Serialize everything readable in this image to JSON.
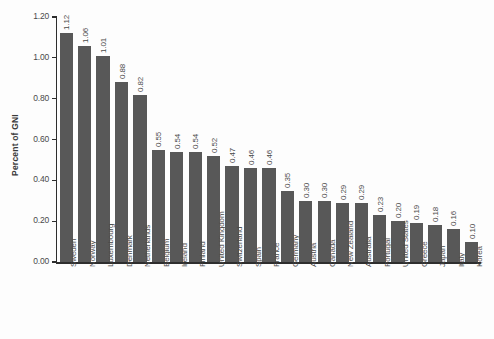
{
  "chart_data": {
    "type": "bar",
    "title": "",
    "subtitle": "",
    "xlabel": "",
    "ylabel": "Percent of GNI",
    "ylim": [
      0.0,
      1.2
    ],
    "ytick_labels": [
      "0.00",
      "0.20",
      "0.40",
      "0.60",
      "0.80",
      "1.00",
      "1.20"
    ],
    "ytick_values": [
      0.0,
      0.2,
      0.4,
      0.6,
      0.8,
      1.0,
      1.2
    ],
    "grid": false,
    "legend": false,
    "bar_color": "#585858",
    "axis_color": "#2e2e2e",
    "background_color": "#fdfdfd",
    "categories": [
      "Sweden",
      "Norway",
      "Luxembourg",
      "Denmark",
      "Netherlands",
      "Belgium",
      "Ireland",
      "Finland",
      "United Kingdom",
      "Switzerland",
      "Spain",
      "France",
      "Germany",
      "Austria",
      "Canada",
      "New Zealand",
      "Australia",
      "Portugal",
      "United States",
      "Greece",
      "Japan",
      "Italy",
      "Korea"
    ],
    "values": [
      1.12,
      1.06,
      1.01,
      0.88,
      0.82,
      0.55,
      0.54,
      0.54,
      0.52,
      0.47,
      0.46,
      0.46,
      0.35,
      0.3,
      0.3,
      0.29,
      0.29,
      0.23,
      0.2,
      0.19,
      0.18,
      0.16,
      0.1
    ],
    "value_labels": [
      "1.12",
      "1.06",
      "1.01",
      "0.88",
      "0.82",
      "0.55",
      "0.54",
      "0.54",
      "0.52",
      "0.47",
      "0.46",
      "0.46",
      "0.35",
      "0.30",
      "0.30",
      "0.29",
      "0.29",
      "0.23",
      "0.20",
      "0.19",
      "0.18",
      "0.16",
      "0.10"
    ]
  }
}
